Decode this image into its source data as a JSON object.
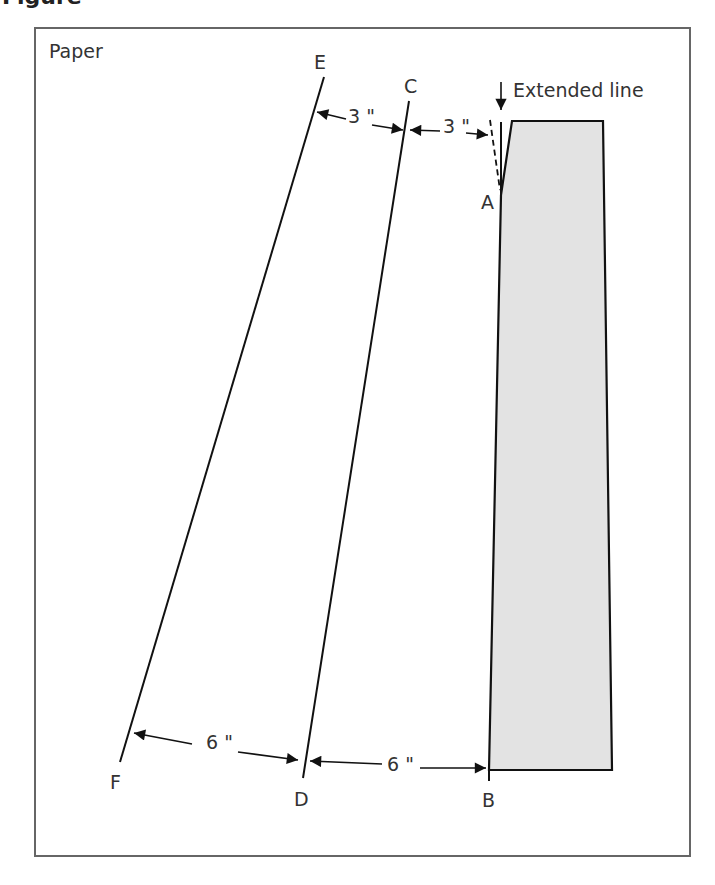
{
  "figure": {
    "heading_fragment": "Figure",
    "frame_label": "Paper",
    "colors": {
      "stroke": "#111111",
      "fill": "#e3e3e3",
      "frame": "#666666",
      "text": "#333333"
    }
  },
  "points": {
    "A": "A",
    "B": "B",
    "C": "C",
    "D": "D",
    "E": "E",
    "F": "F"
  },
  "annotations": {
    "extended_line": "Extended line"
  },
  "dimensions": {
    "top_EC": "3 \"",
    "top_CA": "3 \"",
    "bottom_FD": "6 \"",
    "bottom_DB": "6 \""
  }
}
